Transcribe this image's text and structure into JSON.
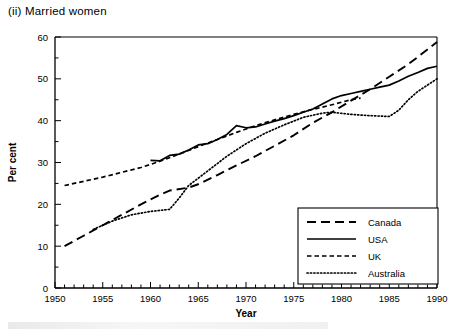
{
  "figure": {
    "title": "(ii) Married women",
    "xlabel": "Year",
    "ylabel": "Per cent"
  },
  "legend": {
    "items": [
      {
        "label": "Canada",
        "style": "long-dash"
      },
      {
        "label": "USA",
        "style": "solid"
      },
      {
        "label": "UK",
        "style": "short-dash"
      },
      {
        "label": "Australia",
        "style": "dotted"
      }
    ]
  },
  "axis": {
    "x_ticks": [
      "1950",
      "1955",
      "1960",
      "1965",
      "1970",
      "1975",
      "1980",
      "1985",
      "1990"
    ],
    "y_ticks": [
      "0",
      "10",
      "20",
      "30",
      "40",
      "50",
      "60"
    ]
  },
  "chart_data": {
    "type": "line",
    "title": "(ii) Married women",
    "xlabel": "Year",
    "ylabel": "Per cent",
    "xlim": [
      1950,
      1990
    ],
    "ylim": [
      0,
      60
    ],
    "x_ticks": [
      1950,
      1955,
      1960,
      1965,
      1970,
      1975,
      1980,
      1985,
      1990
    ],
    "y_ticks": [
      0,
      10,
      20,
      30,
      40,
      50,
      60
    ],
    "x_minor_tick_step": 1,
    "y_minor_tick_step": 5,
    "grid": false,
    "legend_position": "lower-right",
    "series": [
      {
        "name": "Canada",
        "style": "long-dash",
        "x": [
          1951,
          1953,
          1955,
          1957,
          1959,
          1961,
          1962,
          1964,
          1965,
          1967,
          1969,
          1971,
          1973,
          1975,
          1977,
          1979,
          1981,
          1983,
          1985,
          1987,
          1989,
          1990
        ],
        "values": [
          10.0,
          12.5,
          15.0,
          17.5,
          20.0,
          22.3,
          23.3,
          24.0,
          24.8,
          27.0,
          29.3,
          31.5,
          34.0,
          36.5,
          39.5,
          42.0,
          44.8,
          47.5,
          50.5,
          53.5,
          57.0,
          58.8
        ]
      },
      {
        "name": "USA",
        "style": "solid",
        "x": [
          1960,
          1961,
          1962,
          1963,
          1964,
          1965,
          1966,
          1967,
          1968,
          1969,
          1970,
          1971,
          1972,
          1973,
          1974,
          1975,
          1976,
          1977,
          1978,
          1979,
          1980,
          1981,
          1982,
          1983,
          1984,
          1985,
          1986,
          1987,
          1988,
          1989,
          1990
        ],
        "values": [
          30.5,
          30.4,
          31.7,
          32.0,
          33.0,
          34.2,
          34.5,
          35.5,
          36.7,
          38.8,
          38.3,
          38.5,
          39.2,
          39.9,
          40.5,
          41.2,
          42.0,
          42.8,
          44.0,
          45.2,
          46.0,
          46.5,
          47.0,
          47.5,
          48.0,
          48.5,
          49.5,
          50.6,
          51.5,
          52.5,
          53.0
        ]
      },
      {
        "name": "UK",
        "style": "short-dash",
        "x": [
          1951,
          1955,
          1959,
          1961,
          1963,
          1965,
          1967,
          1969,
          1971,
          1973,
          1975,
          1977,
          1979,
          1981,
          1982
        ],
        "values": [
          24.5,
          26.5,
          28.8,
          30.3,
          32.0,
          33.8,
          35.5,
          37.2,
          38.8,
          40.2,
          41.5,
          42.7,
          43.8,
          45.0,
          45.4
        ]
      },
      {
        "name": "Australia",
        "style": "dotted",
        "x": [
          1954,
          1956,
          1958,
          1960,
          1962,
          1963,
          1964,
          1966,
          1968,
          1970,
          1972,
          1974,
          1976,
          1978,
          1979,
          1981,
          1983,
          1985,
          1986,
          1987,
          1988,
          1989,
          1990
        ],
        "values": [
          14.0,
          16.0,
          17.5,
          18.3,
          18.8,
          21.5,
          24.5,
          28.0,
          31.5,
          34.5,
          37.0,
          39.0,
          40.8,
          41.8,
          42.0,
          41.5,
          41.2,
          41.0,
          42.5,
          45.0,
          47.0,
          48.5,
          50.0
        ]
      }
    ]
  }
}
